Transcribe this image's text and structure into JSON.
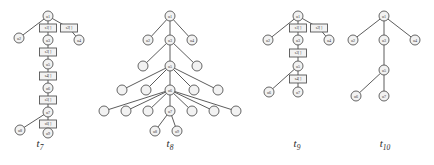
{
  "figure": {
    "background": "#ffffff",
    "node_fill": "#f2f2f2",
    "node_stroke": "#555555",
    "edge_color": "#4a4a4a",
    "label_color": "#3a3a3a"
  },
  "trees": [
    {
      "id": "t7",
      "caption": "t",
      "caption_sub": "7",
      "caption_x": 40,
      "caption_y": 137,
      "origin_x": 0,
      "nodes": [
        {
          "name": "t7-node-u1",
          "label": "u1",
          "shape": "circle",
          "x": 48,
          "y": 16,
          "r": 5
        },
        {
          "name": "t7-node-s1",
          "label": "s1[ ]",
          "shape": "rect",
          "x": 48,
          "y": 28,
          "w": 17,
          "h": 8
        },
        {
          "name": "t7-node-s2",
          "label": "s2[ ]",
          "shape": "rect",
          "x": 69,
          "y": 28,
          "w": 17,
          "h": 8
        },
        {
          "name": "t7-node-u2",
          "label": "u2",
          "shape": "circle",
          "x": 19,
          "y": 38,
          "r": 5
        },
        {
          "name": "t7-node-u3",
          "label": "u3",
          "shape": "circle",
          "x": 48,
          "y": 40,
          "r": 5
        },
        {
          "name": "t7-node-u4",
          "label": "u4",
          "shape": "circle",
          "x": 79,
          "y": 40,
          "r": 5
        },
        {
          "name": "t7-node-s3",
          "label": "s3[ ]",
          "shape": "rect",
          "x": 48,
          "y": 52,
          "w": 17,
          "h": 8
        },
        {
          "name": "t7-node-u5",
          "label": "u5",
          "shape": "circle",
          "x": 48,
          "y": 64,
          "r": 5
        },
        {
          "name": "t7-node-s4",
          "label": "s4[ ]",
          "shape": "rect",
          "x": 48,
          "y": 76,
          "w": 17,
          "h": 8
        },
        {
          "name": "t7-node-u6",
          "label": "u6",
          "shape": "circle",
          "x": 48,
          "y": 88,
          "r": 5
        },
        {
          "name": "t7-node-s5",
          "label": "s5[ ]",
          "shape": "rect",
          "x": 48,
          "y": 100,
          "w": 17,
          "h": 8
        },
        {
          "name": "t7-node-u7",
          "label": "u7",
          "shape": "circle",
          "x": 48,
          "y": 112,
          "r": 5
        },
        {
          "name": "t7-node-s6",
          "label": "s6[ ]",
          "shape": "rect",
          "x": 48,
          "y": 124,
          "w": 17,
          "h": 8
        },
        {
          "name": "t7-node-u8",
          "label": "u8",
          "shape": "circle",
          "x": 20,
          "y": 130,
          "r": 5
        },
        {
          "name": "t7-node-u9",
          "label": "u9",
          "shape": "circle",
          "x": 48,
          "y": 133,
          "r": 5
        }
      ],
      "edges": [
        [
          48,
          16,
          48,
          28
        ],
        [
          48,
          16,
          69,
          28
        ],
        [
          48,
          16,
          19,
          38
        ],
        [
          48,
          28,
          48,
          40
        ],
        [
          69,
          28,
          79,
          40
        ],
        [
          48,
          40,
          48,
          52
        ],
        [
          48,
          52,
          48,
          64
        ],
        [
          48,
          64,
          48,
          76
        ],
        [
          48,
          76,
          48,
          88
        ],
        [
          48,
          88,
          48,
          100
        ],
        [
          48,
          100,
          48,
          112
        ],
        [
          48,
          112,
          48,
          124
        ],
        [
          48,
          112,
          20,
          130
        ],
        [
          48,
          124,
          48,
          133
        ]
      ]
    },
    {
      "id": "t8",
      "caption": "t",
      "caption_sub": "8",
      "caption_x": 170,
      "caption_y": 137,
      "origin_x": 0,
      "nodes": [
        {
          "name": "t8-node-u1",
          "label": "u1",
          "shape": "circle",
          "x": 170,
          "y": 16,
          "r": 5
        },
        {
          "name": "t8-node-u2",
          "label": "u2",
          "shape": "circle",
          "x": 148,
          "y": 40,
          "r": 5
        },
        {
          "name": "t8-node-u3",
          "label": "u3",
          "shape": "circle",
          "x": 170,
          "y": 40,
          "r": 5
        },
        {
          "name": "t8-node-u4",
          "label": "u4",
          "shape": "circle",
          "x": 192,
          "y": 40,
          "r": 5
        },
        {
          "name": "t8-leaf-a",
          "label": "",
          "shape": "circle",
          "x": 143,
          "y": 66,
          "r": 5
        },
        {
          "name": "t8-node-u5",
          "label": "u5",
          "shape": "circle",
          "x": 170,
          "y": 66,
          "r": 5
        },
        {
          "name": "t8-leaf-b",
          "label": "",
          "shape": "circle",
          "x": 197,
          "y": 66,
          "r": 5
        },
        {
          "name": "t8-leaf-c",
          "label": "",
          "shape": "circle",
          "x": 122,
          "y": 90,
          "r": 5
        },
        {
          "name": "t8-leaf-d",
          "label": "",
          "shape": "circle",
          "x": 146,
          "y": 90,
          "r": 5
        },
        {
          "name": "t8-node-u6",
          "label": "u6",
          "shape": "circle",
          "x": 170,
          "y": 90,
          "r": 5
        },
        {
          "name": "t8-leaf-e",
          "label": "",
          "shape": "circle",
          "x": 194,
          "y": 90,
          "r": 5
        },
        {
          "name": "t8-leaf-f",
          "label": "",
          "shape": "circle",
          "x": 218,
          "y": 90,
          "r": 5
        },
        {
          "name": "t8-leaf-g",
          "label": "",
          "shape": "circle",
          "x": 104,
          "y": 111,
          "r": 5
        },
        {
          "name": "t8-leaf-h",
          "label": "",
          "shape": "circle",
          "x": 126,
          "y": 111,
          "r": 5
        },
        {
          "name": "t8-leaf-i",
          "label": "",
          "shape": "circle",
          "x": 148,
          "y": 111,
          "r": 5
        },
        {
          "name": "t8-node-u7",
          "label": "u7",
          "shape": "circle",
          "x": 170,
          "y": 111,
          "r": 5
        },
        {
          "name": "t8-leaf-j",
          "label": "",
          "shape": "circle",
          "x": 192,
          "y": 111,
          "r": 5
        },
        {
          "name": "t8-leaf-k",
          "label": "",
          "shape": "circle",
          "x": 214,
          "y": 111,
          "r": 5
        },
        {
          "name": "t8-leaf-l",
          "label": "",
          "shape": "circle",
          "x": 236,
          "y": 111,
          "r": 5
        },
        {
          "name": "t8-node-u8",
          "label": "u8",
          "shape": "circle",
          "x": 155,
          "y": 131,
          "r": 5
        },
        {
          "name": "t8-node-u9",
          "label": "u9",
          "shape": "circle",
          "x": 177,
          "y": 131,
          "r": 5
        }
      ],
      "edges": [
        [
          170,
          16,
          148,
          40
        ],
        [
          170,
          16,
          170,
          40
        ],
        [
          170,
          16,
          192,
          40
        ],
        [
          170,
          40,
          143,
          66
        ],
        [
          170,
          40,
          170,
          66
        ],
        [
          170,
          40,
          197,
          66
        ],
        [
          170,
          66,
          122,
          90
        ],
        [
          170,
          66,
          146,
          90
        ],
        [
          170,
          66,
          170,
          90
        ],
        [
          170,
          66,
          194,
          90
        ],
        [
          170,
          66,
          218,
          90
        ],
        [
          170,
          90,
          104,
          111
        ],
        [
          170,
          90,
          126,
          111
        ],
        [
          170,
          90,
          148,
          111
        ],
        [
          170,
          90,
          170,
          111
        ],
        [
          170,
          90,
          192,
          111
        ],
        [
          170,
          90,
          214,
          111
        ],
        [
          170,
          90,
          236,
          111
        ],
        [
          170,
          111,
          155,
          131
        ],
        [
          170,
          111,
          177,
          131
        ]
      ]
    },
    {
      "id": "t9",
      "caption": "t",
      "caption_sub": "9",
      "caption_x": 297,
      "caption_y": 137,
      "origin_x": 0,
      "nodes": [
        {
          "name": "t9-node-u1",
          "label": "u1",
          "shape": "circle",
          "x": 298,
          "y": 16,
          "r": 5
        },
        {
          "name": "t9-node-s1",
          "label": "s1[ ]",
          "shape": "rect",
          "x": 298,
          "y": 28,
          "w": 17,
          "h": 8
        },
        {
          "name": "t9-node-s2",
          "label": "s2[ ]",
          "shape": "rect",
          "x": 319,
          "y": 28,
          "w": 17,
          "h": 8
        },
        {
          "name": "t9-node-u2",
          "label": "u2",
          "shape": "circle",
          "x": 268,
          "y": 40,
          "r": 5
        },
        {
          "name": "t9-node-u3",
          "label": "u3",
          "shape": "circle",
          "x": 298,
          "y": 40,
          "r": 5
        },
        {
          "name": "t9-node-u4",
          "label": "u4",
          "shape": "circle",
          "x": 329,
          "y": 40,
          "r": 5
        },
        {
          "name": "t9-node-s3",
          "label": "s3[ ]",
          "shape": "rect",
          "x": 298,
          "y": 53,
          "w": 17,
          "h": 8
        },
        {
          "name": "t9-node-u5",
          "label": "u5",
          "shape": "circle",
          "x": 298,
          "y": 66,
          "r": 5
        },
        {
          "name": "t9-node-s4",
          "label": "s4[ ]",
          "shape": "rect",
          "x": 298,
          "y": 79,
          "w": 17,
          "h": 8
        },
        {
          "name": "t9-node-u6",
          "label": "u6",
          "shape": "circle",
          "x": 269,
          "y": 92,
          "r": 5
        },
        {
          "name": "t9-node-u7",
          "label": "u7",
          "shape": "circle",
          "x": 298,
          "y": 92,
          "r": 5
        }
      ],
      "edges": [
        [
          298,
          16,
          298,
          28
        ],
        [
          298,
          16,
          319,
          28
        ],
        [
          298,
          16,
          268,
          40
        ],
        [
          298,
          28,
          298,
          40
        ],
        [
          319,
          28,
          329,
          40
        ],
        [
          298,
          40,
          298,
          53
        ],
        [
          298,
          53,
          298,
          66
        ],
        [
          298,
          66,
          298,
          79
        ],
        [
          298,
          66,
          269,
          92
        ],
        [
          298,
          79,
          298,
          92
        ]
      ]
    },
    {
      "id": "t10",
      "caption": "t",
      "caption_sub": "10",
      "caption_x": 385,
      "caption_y": 137,
      "origin_x": 0,
      "nodes": [
        {
          "name": "t10-node-u1",
          "label": "u1",
          "shape": "circle",
          "x": 384,
          "y": 16,
          "r": 5
        },
        {
          "name": "t10-node-u2",
          "label": "u2",
          "shape": "circle",
          "x": 353,
          "y": 40,
          "r": 5
        },
        {
          "name": "t10-node-u3",
          "label": "u3",
          "shape": "circle",
          "x": 384,
          "y": 40,
          "r": 5
        },
        {
          "name": "t10-node-u4",
          "label": "u4",
          "shape": "circle",
          "x": 415,
          "y": 40,
          "r": 5
        },
        {
          "name": "t10-node-u5",
          "label": "u5",
          "shape": "circle",
          "x": 384,
          "y": 70,
          "r": 5
        },
        {
          "name": "t10-node-u6",
          "label": "u6",
          "shape": "circle",
          "x": 356,
          "y": 96,
          "r": 5
        },
        {
          "name": "t10-node-u7",
          "label": "u7",
          "shape": "circle",
          "x": 384,
          "y": 96,
          "r": 5
        }
      ],
      "edges": [
        [
          384,
          16,
          353,
          40
        ],
        [
          384,
          16,
          384,
          40
        ],
        [
          384,
          16,
          415,
          40
        ],
        [
          384,
          40,
          384,
          70
        ],
        [
          384,
          70,
          356,
          96
        ],
        [
          384,
          70,
          384,
          96
        ]
      ]
    }
  ]
}
